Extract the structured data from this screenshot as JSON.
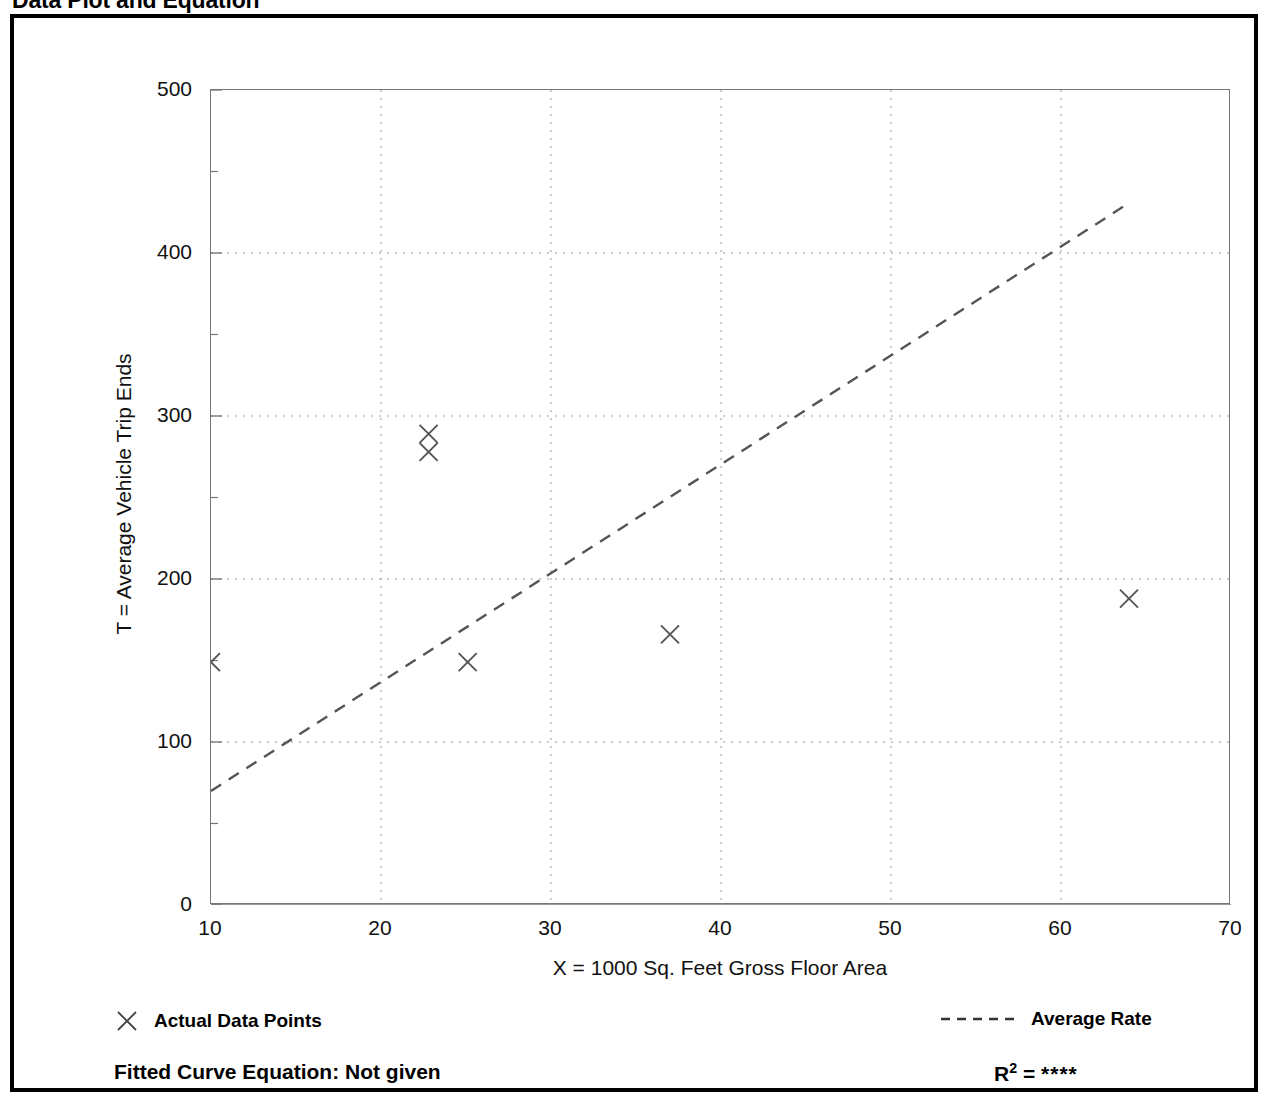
{
  "title": "Data Plot and Equation",
  "chart_data": {
    "type": "scatter",
    "title": "Data Plot and Equation",
    "xlabel": "X = 1000 Sq. Feet Gross Floor Area",
    "ylabel": "T = Average Vehicle Trip Ends",
    "xlim": [
      10,
      70
    ],
    "ylim": [
      0,
      500
    ],
    "xticks": [
      10,
      20,
      30,
      40,
      50,
      60,
      70
    ],
    "xtick_labels": [
      "10",
      "20",
      "30",
      "40",
      "50",
      "60",
      "70"
    ],
    "x_minor_ticks": [
      15,
      25,
      35,
      45,
      55,
      65
    ],
    "yticks": [
      0,
      100,
      200,
      300,
      400,
      500
    ],
    "ytick_labels": [
      "0",
      "100",
      "200",
      "300",
      "400",
      "500"
    ],
    "y_minor_ticks": [
      50,
      150,
      250,
      350,
      450
    ],
    "grid": "dotted gridlines at major x and y ticks",
    "legend_position": "below plot, left and right",
    "series": [
      {
        "name": "Actual Data Points",
        "type": "scatter",
        "marker": "x",
        "points": [
          {
            "x": 10.0,
            "y": 149
          },
          {
            "x": 22.8,
            "y": 289
          },
          {
            "x": 22.8,
            "y": 278
          },
          {
            "x": 25.1,
            "y": 149
          },
          {
            "x": 37.0,
            "y": 166
          },
          {
            "x": 64.0,
            "y": 188
          }
        ]
      },
      {
        "name": "Average Rate",
        "type": "line",
        "style": "dashed",
        "points": [
          {
            "x": 10.0,
            "y": 70
          },
          {
            "x": 63.9,
            "y": 430
          }
        ]
      }
    ]
  },
  "legend": {
    "data_points_label": "Actual Data Points",
    "average_rate_label": "Average Rate"
  },
  "footer": {
    "equation_label": "Fitted Curve Equation:  Not given",
    "r_label": "R",
    "r_exponent": "2",
    "r_equals": " = ",
    "r_value": "****"
  },
  "colors": {
    "frame": "#000000",
    "axis": "#777777",
    "grid": "#999999",
    "marker": "#555555",
    "line": "#555555",
    "text": "#111111"
  }
}
